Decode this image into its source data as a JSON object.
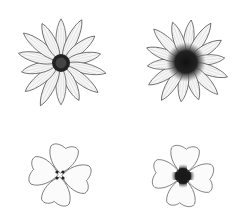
{
  "illustration": {
    "description": "Line drawings of four flowers in a 2x2 arrangement",
    "flowers": [
      {
        "id": "daisy-light-center",
        "type": "radiate",
        "petals": 14,
        "cx": 61,
        "cy": 63,
        "center_radius": 9,
        "petal_length": 48,
        "center_color": "#222222"
      },
      {
        "id": "daisy-dark-center",
        "type": "radiate",
        "petals": 14,
        "cx": 186,
        "cy": 62,
        "center_radius": 16,
        "petal_length": 46,
        "center_color": "#111111"
      },
      {
        "id": "four-petal-light",
        "type": "four-petal",
        "petals": 4,
        "cx": 60,
        "cy": 175,
        "center_radius": 3,
        "petal_length": 30,
        "center_color": "#222222"
      },
      {
        "id": "four-petal-dark",
        "type": "four-petal",
        "petals": 4,
        "cx": 183,
        "cy": 176,
        "center_radius": 9,
        "petal_length": 30,
        "center_color": "#111111"
      }
    ],
    "stroke_color": "#444444",
    "background": "#ffffff"
  }
}
